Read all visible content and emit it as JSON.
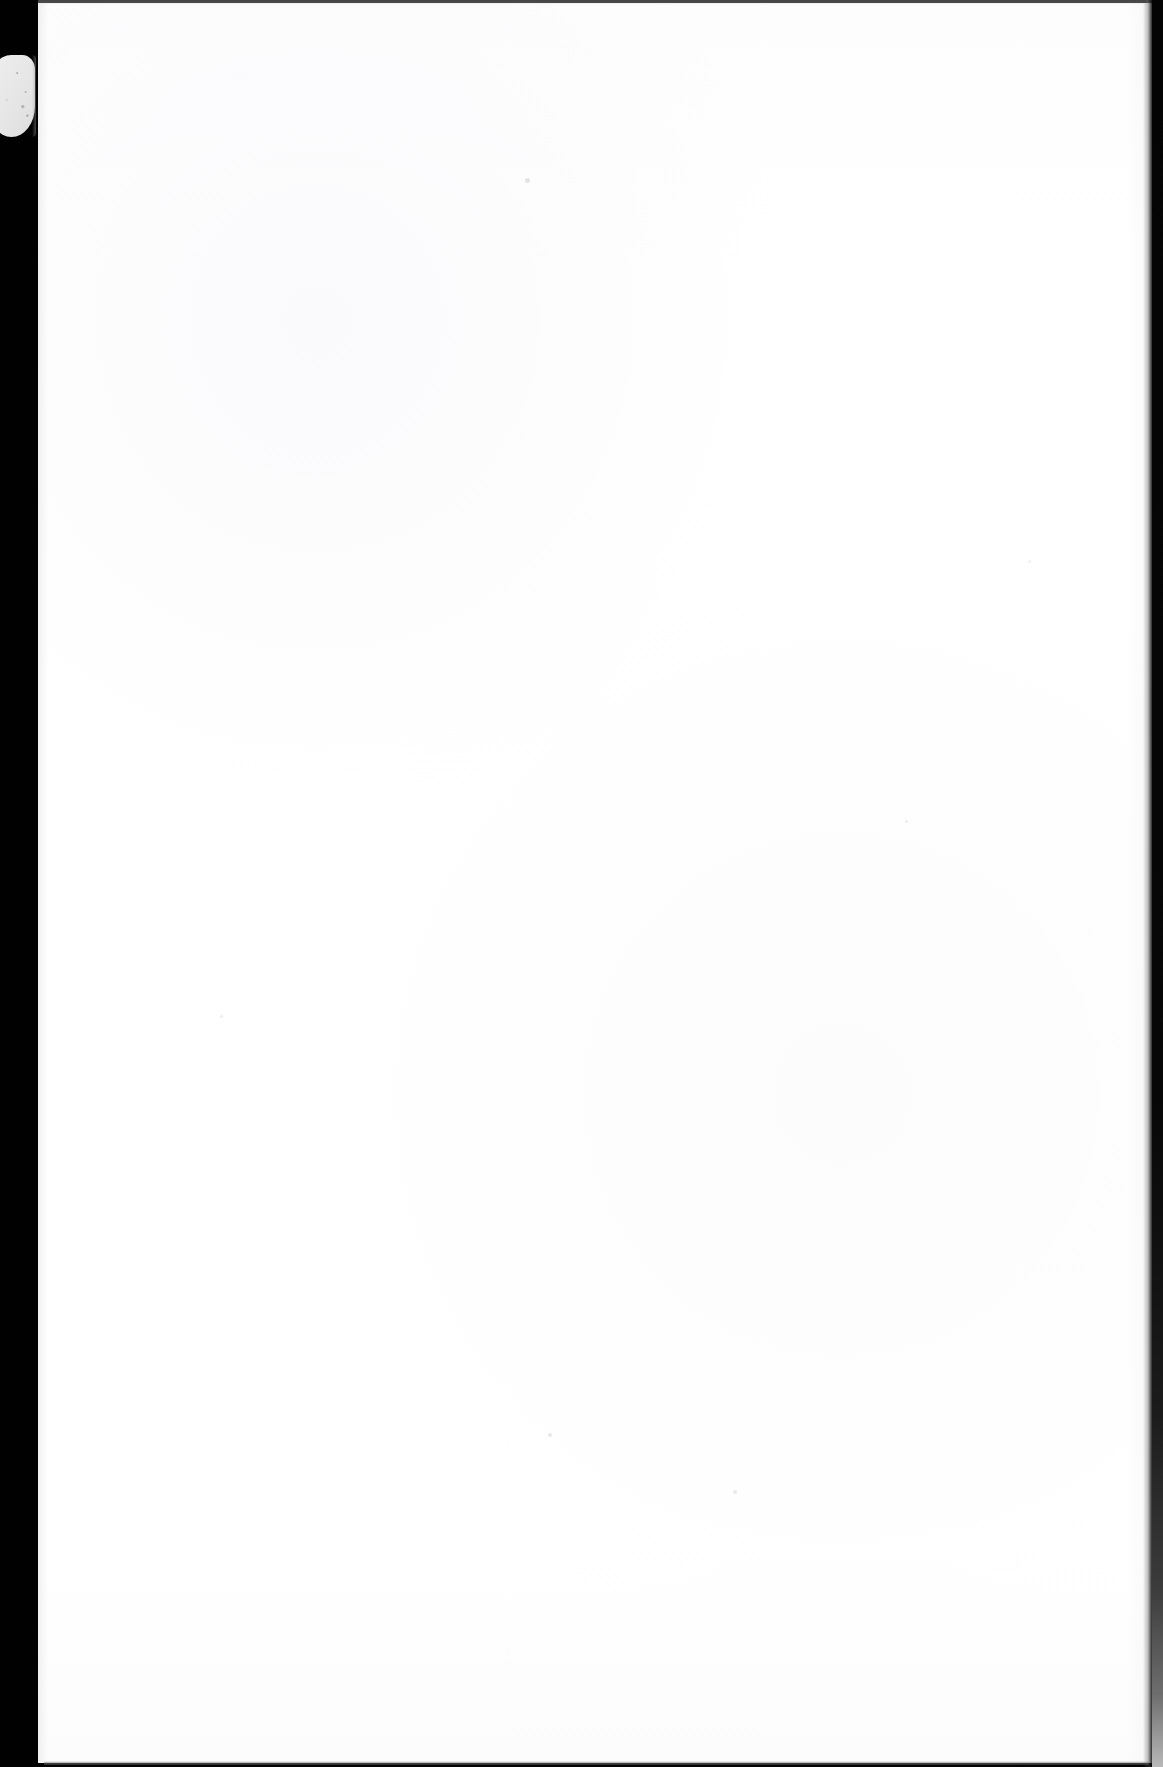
{
  "document": {
    "kind": "scanned-page",
    "page_content_text": "",
    "visible_text": "",
    "page_state_label": "Blank scanned page — no visible text or graphics",
    "width_px": 1163,
    "height_px": 1767
  },
  "sheet": {
    "label": "paper-sheet",
    "fill_color": "#ffffff",
    "left_px": 38,
    "top_px": 3,
    "width_px": 1115,
    "height_px": 1760
  },
  "margins": {
    "left": {
      "label": "scanner-void-left",
      "color": "#010101",
      "width_px": 38
    },
    "right": {
      "label": "scanner-void-right",
      "color": "#040404",
      "width_px": 11
    }
  },
  "bands": {
    "top": {
      "label": "scan-band-top",
      "color": "#7c7c7e"
    },
    "bottom": {
      "label": "scan-band-bottom",
      "color": "#3c3c3e"
    }
  },
  "artifacts": {
    "thumb": {
      "label": "thumb-artifact",
      "color": "#e9e9e9",
      "left_px": 0,
      "top_px": 55,
      "width_px": 35,
      "height_px": 82
    },
    "specks": [
      {
        "x_px": 525,
        "y_px": 178,
        "size_px": 5,
        "opacity": 0.55
      },
      {
        "x_px": 548,
        "y_px": 1433,
        "size_px": 4,
        "opacity": 0.5
      },
      {
        "x_px": 733,
        "y_px": 1490,
        "size_px": 4,
        "opacity": 0.45
      },
      {
        "x_px": 220,
        "y_px": 1015,
        "size_px": 3,
        "opacity": 0.4
      },
      {
        "x_px": 905,
        "y_px": 820,
        "size_px": 3,
        "opacity": 0.35
      },
      {
        "x_px": 1028,
        "y_px": 560,
        "size_px": 3,
        "opacity": 0.3
      }
    ]
  },
  "palette": {
    "paper": "#ffffff",
    "void": "#010101",
    "artifact_gray": "#e9e9e9",
    "edge_shadow": "#a0a0a2"
  }
}
